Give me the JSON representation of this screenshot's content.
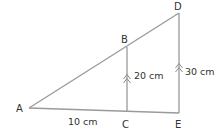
{
  "diagram": {
    "type": "similar-triangles",
    "colors": {
      "line": "#9a9a9a",
      "text": "#333333",
      "background": "#ffffff"
    },
    "points": {
      "A": {
        "label": "A"
      },
      "B": {
        "label": "B"
      },
      "C": {
        "label": "C"
      },
      "D": {
        "label": "D"
      },
      "E": {
        "label": "E"
      }
    },
    "segments": [
      {
        "from": "A",
        "to": "D"
      },
      {
        "from": "A",
        "to": "E"
      },
      {
        "from": "B",
        "to": "C",
        "parallel_marks": 2
      },
      {
        "from": "D",
        "to": "E",
        "parallel_marks": 2
      }
    ],
    "measurements": {
      "AC": "10 cm",
      "BC": "20 cm",
      "DE": "30 cm"
    }
  }
}
